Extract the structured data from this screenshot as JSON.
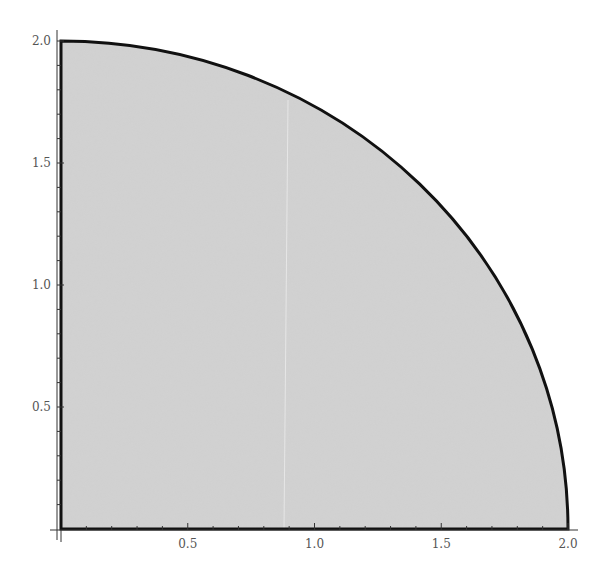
{
  "chart_data": {
    "type": "area",
    "title": "",
    "xlabel": "",
    "ylabel": "",
    "xlim": [
      0,
      2.0
    ],
    "ylim": [
      0,
      2.0
    ],
    "x_ticks": [
      0.5,
      1.0,
      1.5,
      2.0
    ],
    "y_ticks": [
      0.5,
      1.0,
      1.5,
      2.0
    ],
    "x_tick_labels": [
      "0.5",
      "1.0",
      "1.5",
      "2.0"
    ],
    "y_tick_labels": [
      "0.5",
      "1.0",
      "1.5",
      "2.0"
    ],
    "minor_ticks_per_major": 5,
    "grid": false,
    "legend": null,
    "region": {
      "shape": "quarter-circle",
      "radius": 2.0,
      "center": [
        0,
        0
      ],
      "boundary_points": [
        [
          0,
          2.0
        ],
        [
          0.5,
          1.936
        ],
        [
          1.0,
          1.732
        ],
        [
          1.5,
          1.323
        ],
        [
          1.732,
          1.0
        ],
        [
          1.936,
          0.5
        ],
        [
          2.0,
          0
        ]
      ]
    },
    "colors": {
      "fill": "#d3d3d3",
      "boundary": "#111111",
      "axis": "#333333",
      "tick_label": "#555555"
    }
  }
}
